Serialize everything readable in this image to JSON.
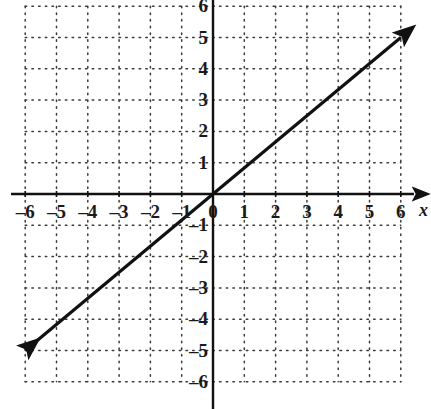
{
  "chart_data": {
    "type": "line",
    "title": "",
    "subtitle": "",
    "xlabel": "x",
    "ylabel": "",
    "xlim": [
      -6,
      6
    ],
    "ylim": [
      -6,
      6
    ],
    "grid": true,
    "grid_style": "dotted",
    "legend": "none",
    "x_ticks": [
      -6,
      -5,
      -4,
      -3,
      -2,
      -1,
      0,
      1,
      2,
      3,
      4,
      5,
      6
    ],
    "y_ticks": [
      -6,
      -5,
      -4,
      -3,
      -2,
      -1,
      1,
      2,
      3,
      4,
      5,
      6
    ],
    "x_tick_labels": [
      "–6",
      "–5",
      "–4",
      "–3",
      "–2",
      "–1",
      "0",
      "1",
      "2",
      "3",
      "4",
      "5",
      "6"
    ],
    "y_tick_labels": [
      "–6",
      "–5",
      "–4",
      "–3",
      "–2",
      "–1",
      "1",
      "2",
      "3",
      "4",
      "5",
      "6"
    ],
    "origin_label": "0",
    "series": [
      {
        "name": "line",
        "equation": "y = (5/6)x",
        "slope": 0.8333,
        "intercept": 0,
        "arrow_start": true,
        "arrow_end": true,
        "x": [
          -6,
          6
        ],
        "y": [
          -5,
          5
        ],
        "points": [
          {
            "x": -6,
            "y": -5
          },
          {
            "x": -3,
            "y": -2.5
          },
          {
            "x": 0,
            "y": 0
          },
          {
            "x": 3,
            "y": 2.5
          },
          {
            "x": 6,
            "y": 5
          }
        ],
        "color": "#111111",
        "width": 3.2
      }
    ],
    "axis_color": "#111111",
    "grid_color": "#3a3a3a",
    "background": "#ffffff"
  },
  "axes": {
    "x_axis_label": "x",
    "y_axis_label": ""
  },
  "geometry": {
    "origin_px": {
      "x": 213,
      "y": 194
    },
    "unit_px": 31.3,
    "width": 431,
    "height": 409
  }
}
